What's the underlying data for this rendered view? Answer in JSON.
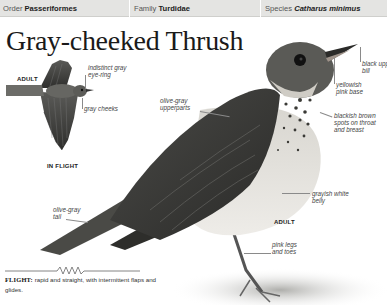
{
  "header": {
    "order_label": "Order",
    "order_value": "Passeriformes",
    "family_label": "Family",
    "family_value": "Turdidae",
    "species_label": "Species",
    "species_value": "Catharus minimus"
  },
  "title": "Gray-cheeked Thrush",
  "inset": {
    "tag_adult": "ADULT",
    "caption": "IN FLIGHT",
    "labels": {
      "eye_ring_line1": "indistinct gray",
      "eye_ring_line2": "eye-ring",
      "cheeks": "gray cheeks"
    }
  },
  "main_bird": {
    "tag_adult": "ADULT",
    "labels": {
      "bill_line1": "black upper",
      "bill_line2": "bill",
      "base_line1": "yellowish",
      "base_line2": "pink base",
      "upperparts_line1": "olive-gray",
      "upperparts_line2": "upperparts",
      "spots_line1": "blackish brown",
      "spots_line2": "spots on throat",
      "spots_line3": "and breast",
      "belly_line1": "grayish white",
      "belly_line2": "belly",
      "tail_line1": "olive-gray",
      "tail_line2": "tail",
      "legs_line1": "pink legs",
      "legs_line2": "and toes"
    }
  },
  "flight": {
    "heading": "FLIGHT:",
    "description": " rapid and  straight, with intermittent flaps and glides."
  },
  "colors": {
    "header_bg": "#e4e4e2",
    "bird_dark": "#3e3e3c",
    "bird_mid": "#6a6a66",
    "belly": "#e9e7e2"
  }
}
